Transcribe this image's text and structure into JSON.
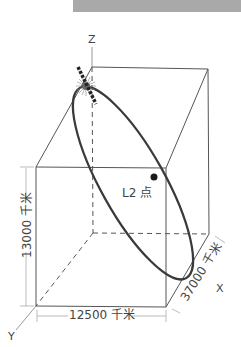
{
  "diagram": {
    "axes": {
      "x": "X",
      "y": "Y",
      "z": "Z"
    },
    "point_label": "L2 点",
    "dimensions": {
      "height": "13000 千米",
      "width": "12500 千米",
      "depth": "37000 千米"
    },
    "colors": {
      "orbit": "#3a3a3a",
      "box": "#4a4a4a",
      "header_bar": "#a9a9a9"
    }
  }
}
